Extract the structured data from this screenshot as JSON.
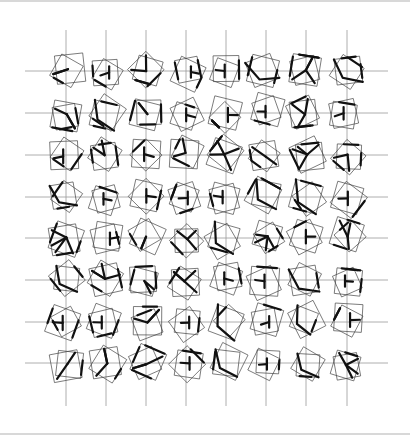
{
  "artwork": {
    "type": "generative-plotter-drawing",
    "grid": {
      "columns": 8,
      "rows": 8,
      "col_x": [
        66,
        106,
        146,
        186,
        226,
        266,
        306,
        347
      ],
      "row_y": [
        71,
        113,
        155,
        197,
        238,
        280,
        322,
        363
      ],
      "line_x_start": 25,
      "line_x_end": 388,
      "line_y_start": 30,
      "line_y_end": 406,
      "line_color": "#9a9a9a"
    },
    "glyph": {
      "square_size": 30,
      "ink_color": "#111111",
      "outline_color": "#444444",
      "seed": 1971
    }
  }
}
